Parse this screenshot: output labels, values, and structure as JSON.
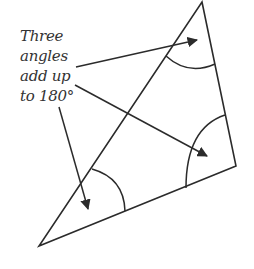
{
  "diagram": {
    "label_lines": [
      "Three",
      "angles",
      "add up",
      "to 180°"
    ],
    "stroke_color": "#2b2b2b",
    "text_color": "#333333",
    "triangle": {
      "vertices": [
        [
          202,
          2
        ],
        [
          236,
          166
        ],
        [
          39,
          246
        ]
      ]
    },
    "arcs": [
      {
        "name": "top-angle-arc",
        "path": "M 166 56 Q 188 76 215 64"
      },
      {
        "name": "right-angle-arc",
        "path": "M 186 188 Q 186 128 225 115"
      },
      {
        "name": "left-angle-arc",
        "path": "M 92 169 Q 124 178 125 211"
      }
    ],
    "arrows": [
      {
        "name": "arrow-to-top-angle",
        "x1": 76,
        "y1": 67,
        "x2": 197,
        "y2": 40
      },
      {
        "name": "arrow-to-right-angle",
        "x1": 75,
        "y1": 85,
        "x2": 207,
        "y2": 156
      },
      {
        "name": "arrow-to-left-angle",
        "x1": 59,
        "y1": 107,
        "x2": 88,
        "y2": 209
      }
    ]
  }
}
